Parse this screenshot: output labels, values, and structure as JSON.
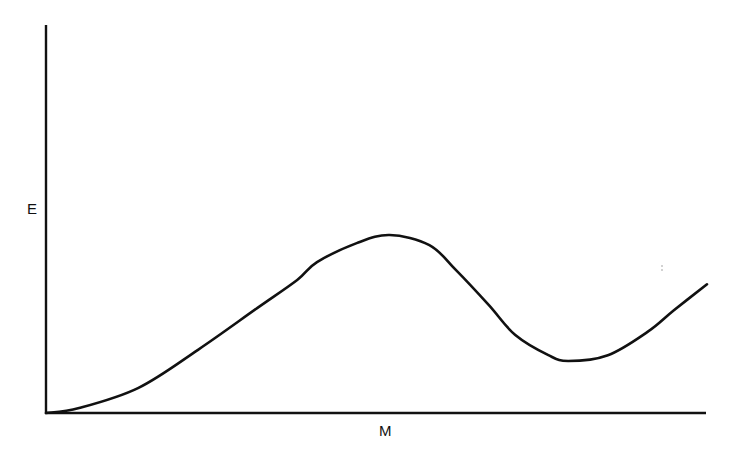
{
  "chart_data": {
    "type": "line",
    "title": "",
    "xlabel": "M",
    "ylabel": "E",
    "xticks": [],
    "yticks": [],
    "grid": false,
    "legend": null,
    "xlim": [
      0,
      1
    ],
    "ylim": [
      0,
      1
    ],
    "series": [
      {
        "name": "E(M)",
        "description": "Energy curve rising from origin to a maximum near M≈0.53, dipping to a local minimum near M≈0.79, then rising again",
        "x": [
          0.0,
          0.05,
          0.14,
          0.23,
          0.32,
          0.38,
          0.41,
          0.47,
          0.52,
          0.58,
          0.62,
          0.67,
          0.71,
          0.76,
          0.79,
          0.85,
          0.91,
          0.95,
          1.0
        ],
        "y": [
          0.0,
          0.013,
          0.065,
          0.163,
          0.271,
          0.343,
          0.389,
          0.438,
          0.459,
          0.433,
          0.369,
          0.278,
          0.201,
          0.149,
          0.134,
          0.149,
          0.209,
          0.265,
          0.332
        ]
      }
    ],
    "annotations": [
      {
        "type": "local-maximum",
        "x": 0.52,
        "y": 0.459
      },
      {
        "type": "local-minimum",
        "x": 0.79,
        "y": 0.134
      }
    ]
  },
  "colors": {
    "line": "#111111",
    "background": "#ffffff"
  }
}
